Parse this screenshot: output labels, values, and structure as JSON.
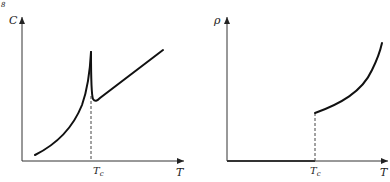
{
  "corner_mark": "8",
  "panels": [
    {
      "id": "heat-capacity",
      "y_label": "C",
      "x_label": "T",
      "critical_label": "T",
      "critical_sub": "c",
      "description": "Heat capacity vs temperature: power-law rise to a sharp peak at Tc, drop, then linear increase above Tc"
    },
    {
      "id": "resistivity",
      "y_label": "ρ",
      "x_label": "T",
      "critical_label": "T",
      "critical_sub": "c",
      "description": "Resistivity vs temperature: zero below Tc, jumps to finite value at Tc and rises with T"
    }
  ]
}
